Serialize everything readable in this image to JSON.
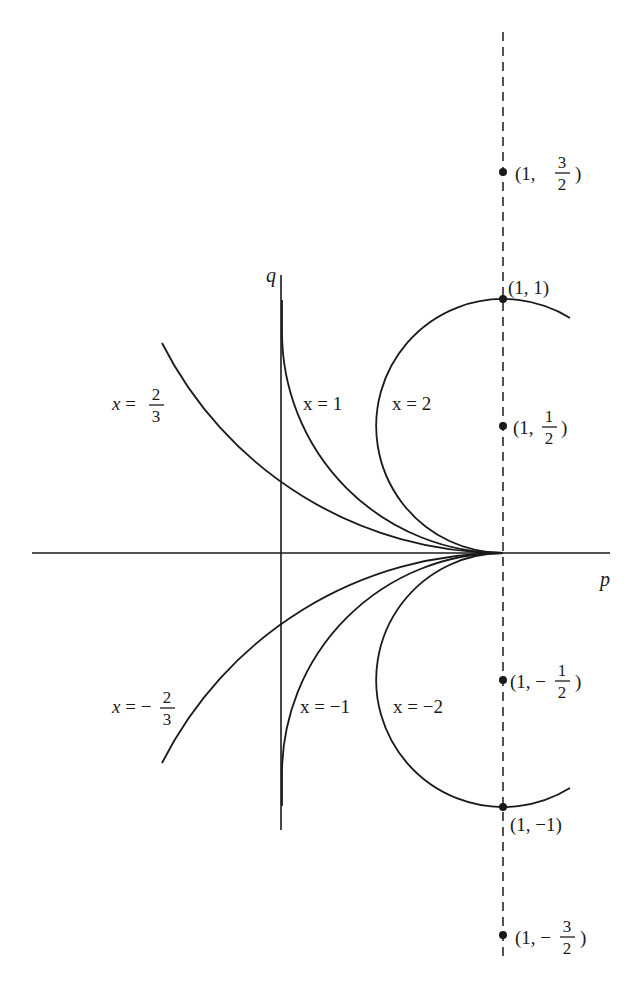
{
  "diagram": {
    "axes": {
      "horizontal_label": "p",
      "vertical_label": "q"
    },
    "curves": [
      {
        "id": "x_2_3",
        "label_prefix": "x =",
        "num": "2",
        "den": "3",
        "sign": ""
      },
      {
        "id": "x_1",
        "label": "x = 1"
      },
      {
        "id": "x_2",
        "label": "x = 2"
      },
      {
        "id": "x_neg_2_3",
        "label_prefix": "x = −",
        "num": "2",
        "den": "3",
        "sign": "−"
      },
      {
        "id": "x_neg_1",
        "label": "x = −1"
      },
      {
        "id": "x_neg_2",
        "label": "x = −2"
      }
    ],
    "points": [
      {
        "id": "p_1_3_2",
        "open": "(1,",
        "num": "3",
        "den": "2",
        "close": ")",
        "neg": false
      },
      {
        "id": "p_1_1",
        "label": "(1, 1)"
      },
      {
        "id": "p_1_1_2",
        "open": "(1,",
        "num": "1",
        "den": "2",
        "close": ")",
        "neg": false
      },
      {
        "id": "p_1_neg_1_2",
        "open": "(1, −",
        "num": "1",
        "den": "2",
        "close": ")",
        "neg": true
      },
      {
        "id": "p_1_neg_1",
        "label": "(1, −1)"
      },
      {
        "id": "p_1_neg_3_2",
        "open": "(1, −",
        "num": "3",
        "den": "2",
        "close": ")",
        "neg": true
      }
    ],
    "dashed_line": "p = 1",
    "colors": {
      "ink": "#1a1a1a",
      "background": "#ffffff"
    }
  }
}
